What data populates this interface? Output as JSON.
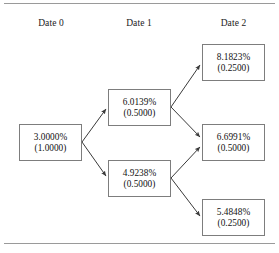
{
  "figure": {
    "type": "binomial-interest-rate-tree",
    "columns": [
      {
        "id": "date0",
        "label": "Date 0"
      },
      {
        "id": "date1",
        "label": "Date 1"
      },
      {
        "id": "date2",
        "label": "Date 2"
      }
    ],
    "nodes": [
      {
        "id": "n0",
        "column": "date0",
        "rate": "3.0000%",
        "prob": "(1.0000)"
      },
      {
        "id": "n1u",
        "column": "date1",
        "rate": "6.0139%",
        "prob": "(0.5000)"
      },
      {
        "id": "n1d",
        "column": "date1",
        "rate": "4.9238%",
        "prob": "(0.5000)"
      },
      {
        "id": "n2u",
        "column": "date2",
        "rate": "8.1823%",
        "prob": "(0.2500)"
      },
      {
        "id": "n2m",
        "column": "date2",
        "rate": "6.6991%",
        "prob": "(0.5000)"
      },
      {
        "id": "n2d",
        "column": "date2",
        "rate": "5.4848%",
        "prob": "(0.2500)"
      }
    ],
    "edges": [
      {
        "from": "n0",
        "to": "n1u"
      },
      {
        "from": "n0",
        "to": "n1d"
      },
      {
        "from": "n1u",
        "to": "n2u"
      },
      {
        "from": "n1u",
        "to": "n2m"
      },
      {
        "from": "n1d",
        "to": "n2m"
      },
      {
        "from": "n1d",
        "to": "n2d"
      }
    ],
    "colors": {
      "box_border": "#7d7d7d",
      "edge": "#3a3a3a",
      "rule": "#9a9a9a",
      "text": "#111111",
      "background": "#ffffff"
    }
  }
}
